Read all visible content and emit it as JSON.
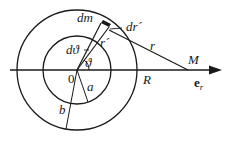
{
  "diagram": {
    "type": "spherical-shell gravitational field geometry",
    "labels": {
      "dm": "dm",
      "dr_prime": "dr´",
      "d_theta": "dϑ",
      "r_prime": "r´",
      "theta": "ϑ",
      "origin": "0",
      "a": "a",
      "b": "b",
      "R": "R",
      "r": "r",
      "M": "M",
      "e_r": "e",
      "e_r_sub": "r"
    },
    "geometry": {
      "center": [
        77,
        70
      ],
      "inner_radius": 34,
      "outer_radius": 60,
      "point_M": [
        188,
        70
      ],
      "axis_start_x": 10,
      "axis_end_x": 222
    },
    "colors": {
      "stroke": "#1a1a1a",
      "background": "#ffffff"
    }
  }
}
